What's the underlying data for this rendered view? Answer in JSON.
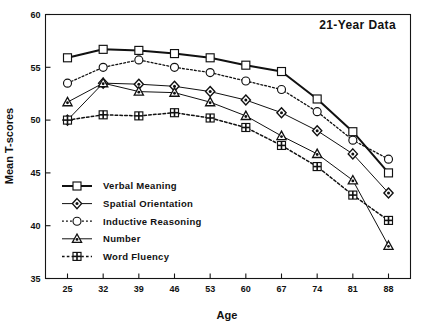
{
  "chart_data": {
    "type": "line",
    "title": "21-Year Data",
    "xlabel": "Age",
    "ylabel": "Mean T-scores",
    "categories": [
      25,
      32,
      39,
      46,
      53,
      60,
      67,
      74,
      81,
      88
    ],
    "xtick_labels": [
      "25",
      "32",
      "39",
      "46",
      "53",
      "60",
      "67",
      "74",
      "81",
      "88"
    ],
    "ytick_labels": [
      "35",
      "40",
      "45",
      "50",
      "55",
      "60"
    ],
    "yticks": [
      35,
      40,
      45,
      50,
      55,
      60
    ],
    "ylim": [
      35,
      60
    ],
    "grid": false,
    "legend_position": "lower-left-inside",
    "series": [
      {
        "name": "Verbal Meaning",
        "marker": "square",
        "linestyle": "solid",
        "linewidth": 2.0,
        "values": [
          55.9,
          56.7,
          56.6,
          56.3,
          55.9,
          55.2,
          54.6,
          52.0,
          48.9,
          45.0
        ]
      },
      {
        "name": "Spatial Orientation",
        "marker": "diamond",
        "linestyle": "solid",
        "linewidth": 1.0,
        "values": [
          50.0,
          53.5,
          53.4,
          53.2,
          52.7,
          51.9,
          50.7,
          49.0,
          46.8,
          43.1
        ]
      },
      {
        "name": "Inductive Reasoning",
        "marker": "circle",
        "linestyle": "dotted",
        "linewidth": 1.3,
        "values": [
          53.5,
          55.0,
          55.7,
          55.0,
          54.5,
          53.7,
          52.9,
          50.8,
          48.1,
          46.3
        ]
      },
      {
        "name": "Number",
        "marker": "triangle",
        "linestyle": "solid",
        "linewidth": 1.0,
        "values": [
          51.7,
          53.5,
          52.7,
          52.6,
          51.7,
          50.4,
          48.5,
          46.8,
          44.3,
          38.1
        ]
      },
      {
        "name": "Word Fluency",
        "marker": "crossed-square",
        "linestyle": "dotted",
        "linewidth": 1.5,
        "values": [
          50.0,
          50.5,
          50.4,
          50.7,
          50.2,
          49.3,
          47.6,
          45.6,
          42.9,
          40.5
        ]
      }
    ]
  },
  "legend": {
    "entries": [
      {
        "label": "Verbal Meaning"
      },
      {
        "label": "Spatial Orientation"
      },
      {
        "label": "Inductive Reasoning"
      },
      {
        "label": "Number"
      },
      {
        "label": "Word Fluency"
      }
    ]
  },
  "colors": {
    "ink": "#111111",
    "background": "#ffffff",
    "marker_fill": "#ffffff"
  }
}
